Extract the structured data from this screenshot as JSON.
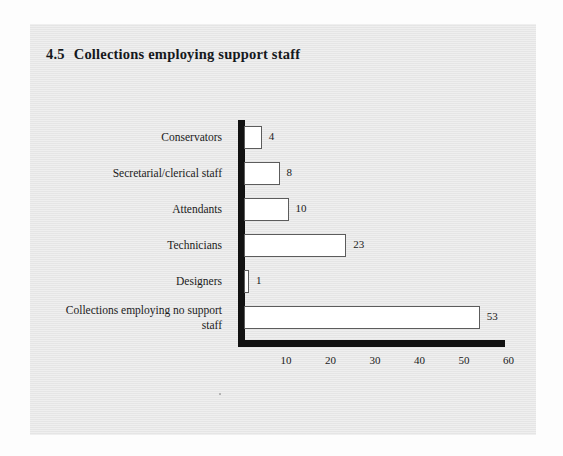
{
  "figure": {
    "number": "4.5",
    "title": "Collections employing support staff"
  },
  "chart_data": {
    "type": "bar",
    "orientation": "horizontal",
    "xlabel": "",
    "ylabel": "",
    "xlim": [
      0,
      60
    ],
    "xticks": [
      10,
      20,
      30,
      40,
      50,
      60
    ],
    "xtick_labels": [
      "10",
      "20",
      "30",
      "40",
      "50",
      "60"
    ],
    "grid": false,
    "legend": false,
    "categories": [
      "Conservators",
      "Secretarial/clerical staff",
      "Attendants",
      "Technicians",
      "Designers",
      "Collections employing no support staff"
    ],
    "values": [
      4,
      8,
      10,
      23,
      1,
      53
    ],
    "data_labels": [
      "4",
      "8",
      "10",
      "23",
      "1",
      "53"
    ],
    "bar_face_color": "#ffffff",
    "bar_edge_color": "#5c5c5c",
    "axis_color": "#121212",
    "panel_color": "#e9e9e9"
  },
  "bars": [
    {
      "label": "Conservators",
      "label_lines": [
        "Conservators"
      ],
      "value": 4,
      "value_text": "4"
    },
    {
      "label": "Secretarial/clerical staff",
      "label_lines": [
        "Secretarial/clerical staff"
      ],
      "value": 8,
      "value_text": "8"
    },
    {
      "label": "Attendants",
      "label_lines": [
        "Attendants"
      ],
      "value": 10,
      "value_text": "10"
    },
    {
      "label": "Technicians",
      "label_lines": [
        "Technicians"
      ],
      "value": 23,
      "value_text": "23"
    },
    {
      "label": "Designers",
      "label_lines": [
        "Designers"
      ],
      "value": 1,
      "value_text": "1"
    },
    {
      "label": "Collections employing no support staff",
      "label_lines": [
        "Collections employing no support",
        "staff"
      ],
      "value": 53,
      "value_text": "53"
    }
  ],
  "axis": {
    "ticks": [
      "10",
      "20",
      "30",
      "40",
      "50",
      "60"
    ]
  }
}
